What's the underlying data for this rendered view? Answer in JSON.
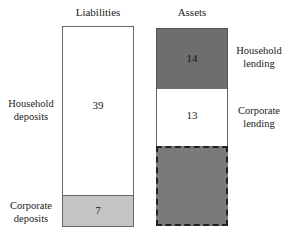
{
  "diagram": {
    "type": "balance-sheet",
    "columns": {
      "liabilities": {
        "title": "Liabilities",
        "items": [
          {
            "label_line1": "Household",
            "label_line2": "deposits",
            "value": "39",
            "fill": "#ffffff"
          },
          {
            "label_line1": "Corporate",
            "label_line2": "deposits",
            "value": "7",
            "fill": "#c4c4c4"
          }
        ]
      },
      "assets": {
        "title": "Assets",
        "items": [
          {
            "label_line1": "Household",
            "label_line2": "lending",
            "value": "14",
            "fill": "#6e6e6e"
          },
          {
            "label_line1": "Corporate",
            "label_line2": "lending",
            "value": "13",
            "fill": "#ffffff"
          },
          {
            "label_line1": "",
            "label_line2": "",
            "value": "",
            "fill": "#7a7a7a",
            "border": "dashed"
          }
        ]
      }
    }
  }
}
